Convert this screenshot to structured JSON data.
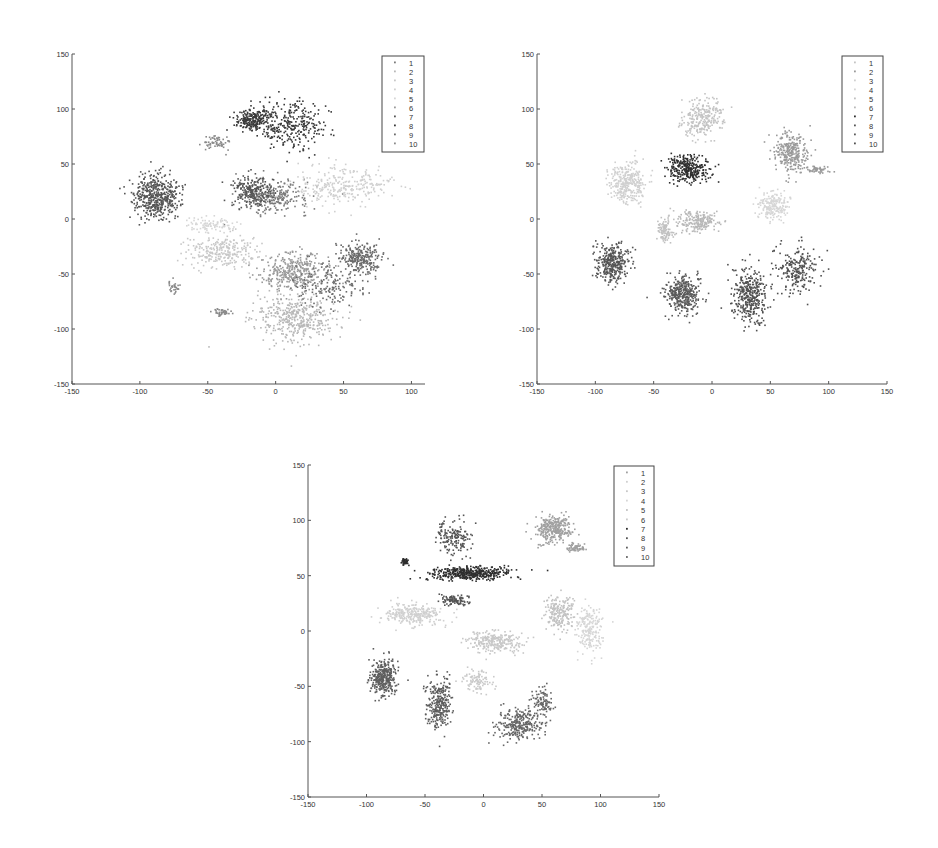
{
  "chart_data": [
    {
      "type": "scatter",
      "title": "",
      "xlabel": "",
      "ylabel": "",
      "xlim": [
        -150,
        110
      ],
      "ylim": [
        -150,
        150
      ],
      "xticks": [
        -150,
        -100,
        -50,
        0,
        50,
        100
      ],
      "yticks": [
        -150,
        -100,
        -50,
        0,
        50,
        100,
        150
      ],
      "grid": false,
      "legend_position": "upper right",
      "legend": [
        "1",
        "2",
        "3",
        "4",
        "5",
        "6",
        "7",
        "8",
        "9",
        "10"
      ],
      "series": [
        {
          "name": "1",
          "color": "#7a7a7a",
          "clusters": [
            [
              -2,
              20,
              22,
              12,
              260
            ]
          ]
        },
        {
          "name": "2",
          "color": "#b8b8b8",
          "clusters": [
            [
              15,
              -90,
              25,
              18,
              420
            ]
          ]
        },
        {
          "name": "3",
          "color": "#c8c8c8",
          "clusters": [
            [
              -40,
              -30,
              22,
              12,
              260
            ]
          ]
        },
        {
          "name": "4",
          "color": "#d0d0d0",
          "clusters": [
            [
              50,
              30,
              28,
              14,
              280
            ]
          ]
        },
        {
          "name": "5",
          "color": "#d6d6d6",
          "clusters": [
            [
              -48,
              -5,
              14,
              6,
              90
            ]
          ]
        },
        {
          "name": "6",
          "color": "#9a9a9a",
          "clusters": [
            [
              15,
              -48,
              22,
              14,
              360
            ]
          ]
        },
        {
          "name": "7",
          "color": "#555555",
          "clusters": [
            [
              -88,
              20,
              14,
              16,
              480
            ],
            [
              -18,
              25,
              12,
              12,
              220
            ]
          ]
        },
        {
          "name": "8",
          "color": "#3a3a3a",
          "clusters": [
            [
              -18,
              90,
              10,
              8,
              200
            ],
            [
              10,
              85,
              22,
              18,
              320
            ]
          ]
        },
        {
          "name": "9",
          "color": "#6a6a6a",
          "clusters": [
            [
              62,
              -35,
              12,
              12,
              260
            ],
            [
              40,
              -60,
              25,
              18,
              160
            ]
          ]
        },
        {
          "name": "10",
          "color": "#8a8a8a",
          "clusters": [
            [
              -40,
              -85,
              6,
              3,
              40
            ],
            [
              -75,
              -62,
              4,
              6,
              30
            ],
            [
              -45,
              70,
              8,
              5,
              60
            ]
          ]
        }
      ]
    },
    {
      "type": "scatter",
      "title": "",
      "xlabel": "",
      "ylabel": "",
      "xlim": [
        -150,
        150
      ],
      "ylim": [
        -150,
        150
      ],
      "xticks": [
        -150,
        -100,
        -50,
        0,
        50,
        100,
        150
      ],
      "yticks": [
        -150,
        -100,
        -50,
        0,
        50,
        100,
        150
      ],
      "grid": false,
      "legend_position": "upper right",
      "legend": [
        "1",
        "2",
        "3",
        "4",
        "5",
        "6",
        "7",
        "8",
        "9",
        "10"
      ],
      "series": [
        {
          "name": "1",
          "color": "#c4c4c4",
          "clusters": [
            [
              -8,
              92,
              14,
              14,
              260
            ]
          ]
        },
        {
          "name": "2",
          "color": "#9a9a9a",
          "clusters": [
            [
              68,
              60,
              12,
              14,
              280
            ],
            [
              90,
              45,
              8,
              3,
              50
            ]
          ]
        },
        {
          "name": "3",
          "color": "#d0d0d0",
          "clusters": [
            [
              -72,
              32,
              13,
              16,
              320
            ]
          ]
        },
        {
          "name": "4",
          "color": "#d6d6d6",
          "clusters": [
            [
              52,
              12,
              10,
              10,
              200
            ]
          ]
        },
        {
          "name": "5",
          "color": "#c0c0c0",
          "clusters": [
            [
              -40,
              -10,
              6,
              10,
              100
            ]
          ]
        },
        {
          "name": "6",
          "color": "#b8b8b8",
          "clusters": [
            [
              -12,
              -2,
              14,
              8,
              200
            ]
          ]
        },
        {
          "name": "7",
          "color": "#2e2e2e",
          "clusters": [
            [
              -20,
              45,
              14,
              10,
              300
            ]
          ]
        },
        {
          "name": "8",
          "color": "#555555",
          "clusters": [
            [
              -85,
              -40,
              12,
              14,
              340
            ]
          ]
        },
        {
          "name": "9",
          "color": "#5a5a5a",
          "clusters": [
            [
              -25,
              -68,
              12,
              14,
              360
            ]
          ]
        },
        {
          "name": "10",
          "color": "#505050",
          "clusters": [
            [
              32,
              -70,
              12,
              20,
              360
            ],
            [
              72,
              -45,
              14,
              18,
              220
            ]
          ]
        }
      ]
    },
    {
      "type": "scatter",
      "title": "",
      "xlabel": "",
      "ylabel": "",
      "xlim": [
        -150,
        150
      ],
      "ylim": [
        -150,
        150
      ],
      "xticks": [
        -150,
        -100,
        -50,
        0,
        50,
        100,
        150
      ],
      "yticks": [
        -150,
        -100,
        -50,
        0,
        50,
        100,
        150
      ],
      "grid": false,
      "legend_position": "upper right",
      "legend": [
        "1",
        "2",
        "3",
        "4",
        "5",
        "6",
        "7",
        "8",
        "9",
        "10"
      ],
      "series": [
        {
          "name": "1",
          "color": "#a0a0a0",
          "clusters": [
            [
              60,
              92,
              12,
              10,
              300
            ],
            [
              78,
              75,
              8,
              3,
              60
            ]
          ]
        },
        {
          "name": "2",
          "color": "#d0d0d0",
          "clusters": [
            [
              -60,
              15,
              22,
              8,
              280
            ]
          ]
        },
        {
          "name": "3",
          "color": "#c8c8c8",
          "clusters": [
            [
              10,
              -10,
              18,
              8,
              260
            ]
          ]
        },
        {
          "name": "4",
          "color": "#d6d6d6",
          "clusters": [
            [
              90,
              0,
              10,
              18,
              200
            ]
          ]
        },
        {
          "name": "5",
          "color": "#c2c2c2",
          "clusters": [
            [
              65,
              15,
              10,
              14,
              200
            ]
          ]
        },
        {
          "name": "6",
          "color": "#cacaca",
          "clusters": [
            [
              -5,
              -45,
              10,
              8,
              100
            ]
          ]
        },
        {
          "name": "7",
          "color": "#2e2e2e",
          "clusters": [
            [
              -12,
              52,
              28,
              5,
              420
            ],
            [
              -67,
              63,
              3,
              3,
              40
            ]
          ]
        },
        {
          "name": "8",
          "color": "#555555",
          "clusters": [
            [
              -25,
              85,
              12,
              14,
              160
            ],
            [
              -25,
              28,
              10,
              4,
              100
            ]
          ]
        },
        {
          "name": "9",
          "color": "#5e5e5e",
          "clusters": [
            [
              -85,
              -42,
              9,
              14,
              340
            ],
            [
              -38,
              -65,
              9,
              20,
              280
            ]
          ]
        },
        {
          "name": "10",
          "color": "#666666",
          "clusters": [
            [
              30,
              -85,
              16,
              12,
              280
            ],
            [
              50,
              -65,
              8,
              12,
              100
            ]
          ]
        }
      ]
    }
  ]
}
